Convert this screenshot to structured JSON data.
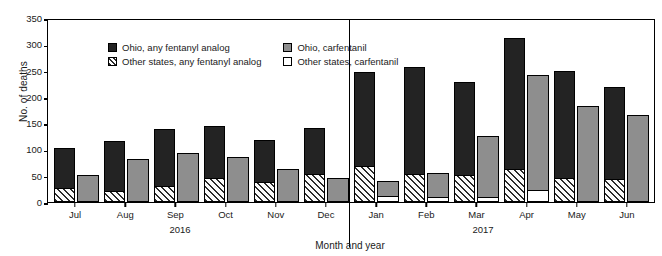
{
  "chart_data": {
    "type": "bar",
    "title": "",
    "xlabel": "Month and year",
    "ylabel": "No. of deaths",
    "ylim": [
      0,
      350
    ],
    "yticks": [
      0,
      50,
      100,
      150,
      200,
      250,
      300,
      350
    ],
    "ytick_labels": [
      "0",
      "50",
      "100",
      "150",
      "200",
      "250",
      "300",
      "350"
    ],
    "grid": false,
    "legend_position": "top-left inside plot",
    "categories": [
      "Jul",
      "Aug",
      "Sep",
      "Oct",
      "Nov",
      "Dec",
      "Jan",
      "Feb",
      "Mar",
      "Apr",
      "May",
      "Jun"
    ],
    "year_labels": [
      "2016",
      "2017"
    ],
    "legend": [
      "Ohio, any fentanyl analog",
      "Ohio, carfentanil",
      "Other states, any fentanyl analog",
      "Other states, carfentanil"
    ],
    "series": [
      {
        "name": "Ohio, any fentanyl analog",
        "color": "#232323",
        "stack": "analog",
        "values": [
          78,
          97,
          109,
          99,
          80,
          88,
          179,
          204,
          179,
          250,
          204,
          175
        ]
      },
      {
        "name": "Other states, any fentanyl analog",
        "color": "#ffffff-hatched",
        "stack": "analog",
        "values": [
          25,
          20,
          30,
          45,
          38,
          52,
          68,
          52,
          50,
          62,
          45,
          43
        ]
      },
      {
        "name": "Ohio, carfentanil",
        "color": "#8e8e8e",
        "stack": "carfentanil",
        "values": [
          52,
          82,
          93,
          86,
          62,
          46,
          30,
          48,
          117,
          219,
          183,
          166
        ]
      },
      {
        "name": "Other states, carfentanil",
        "color": "#ffffff",
        "stack": "carfentanil",
        "values": [
          0,
          0,
          0,
          0,
          0,
          0,
          10,
          8,
          8,
          22,
          0,
          0
        ]
      }
    ],
    "totals": {
      "any_fentanyl_analog": [
        103,
        117,
        139,
        144,
        118,
        140,
        247,
        256,
        229,
        312,
        249,
        218
      ],
      "carfentanil": [
        52,
        82,
        93,
        86,
        62,
        46,
        40,
        56,
        125,
        241,
        183,
        166
      ]
    }
  }
}
